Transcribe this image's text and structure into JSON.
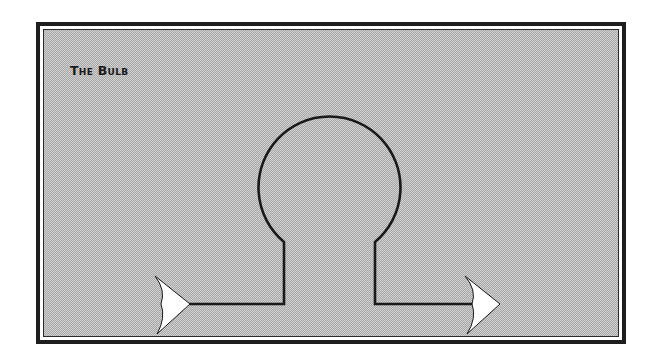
{
  "diagram": {
    "title": "The Bulb",
    "style": {
      "frame_color": "#1e1e1e",
      "fill_pattern": "dithered-gray-halftone",
      "wire_color": "#1a1a1a",
      "arrow_fill": "#ffffff"
    },
    "elements": [
      {
        "id": "input-arrow",
        "type": "arrow",
        "direction": "right",
        "label": ""
      },
      {
        "id": "wire-in",
        "type": "line",
        "label": ""
      },
      {
        "id": "bulb",
        "type": "bulb-outline",
        "shape": "circle-with-neck",
        "label": ""
      },
      {
        "id": "wire-out",
        "type": "line",
        "label": ""
      },
      {
        "id": "output-arrow",
        "type": "arrow",
        "direction": "right",
        "label": ""
      }
    ],
    "flow": [
      "input-arrow",
      "wire-in",
      "bulb",
      "wire-out",
      "output-arrow"
    ]
  }
}
